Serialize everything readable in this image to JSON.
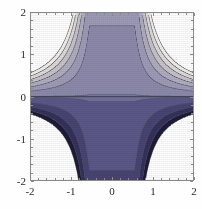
{
  "figure": {
    "kind": "contour-plot",
    "background_color": "#ffffff",
    "frame_color": "#8a8a8a",
    "tick_color": "#8a8a8a",
    "label_color": "#2b2b2b"
  },
  "chart_data": {
    "type": "heatmap",
    "subtype": "filled-contour",
    "title": "",
    "subtitle": "",
    "xlabel": "",
    "ylabel": "",
    "xlim": [
      -2,
      2
    ],
    "ylim": [
      -2,
      2
    ],
    "grid": false,
    "legend": null,
    "legend_position": "none",
    "x_ticks": [
      -2,
      -1,
      0,
      1,
      2
    ],
    "x_tick_labels": [
      "-2",
      "-1",
      "0",
      "1",
      "2"
    ],
    "y_ticks": [
      -2,
      -1,
      0,
      1,
      2
    ],
    "y_tick_labels": [
      "-2",
      "-1",
      "0",
      "1",
      "2"
    ],
    "x_minor_tick_count": 4,
    "y_minor_tick_count": 4,
    "contour_shape": "hyperbolic bands opening toward the four corners, plus a straight horizontal contour along y = 0",
    "zero_contour_line": {
      "axis": "y",
      "value": 0,
      "color": "#3a3a4a"
    },
    "contour_line_color": "#555566",
    "contour_levels": [
      -3,
      -2,
      -1,
      0,
      1,
      2,
      3
    ],
    "color_scale_name": "blue-gray to white (Mathematica default gray-blue)",
    "color_stops": [
      {
        "level": -3,
        "color": "#ffffff",
        "where": "extreme lower-left / lower-right corner tips"
      },
      {
        "level": -2.5,
        "color": "#1d1b38",
        "where": "darkest band, bottom corners"
      },
      {
        "level": -2,
        "color": "#34315c",
        "where": "bottom corners"
      },
      {
        "level": -1.5,
        "color": "#474473",
        "where": "bottom corners"
      },
      {
        "level": -1,
        "color": "#5b5888",
        "where": "lower outer region"
      },
      {
        "level": -0.5,
        "color": "#73709c",
        "where": "lower central region"
      },
      {
        "level": 0,
        "color": "#7e7ba4",
        "where": "just below y = 0"
      },
      {
        "level": 0.5,
        "color": "#8c8aaa",
        "where": "just above y = 0 (central plateau)"
      },
      {
        "level": 1,
        "color": "#9d9bb6",
        "where": "upper central region"
      },
      {
        "level": 1.5,
        "color": "#b0aebe",
        "where": "upper outer region"
      },
      {
        "level": 2,
        "color": "#c6c4c8",
        "where": "top corners"
      },
      {
        "level": 2.5,
        "color": "#dddcd8",
        "where": "top corners"
      },
      {
        "level": 3,
        "color": "#f1f0ea",
        "where": "lightest band, top corners"
      },
      {
        "level": 3.5,
        "color": "#ffffff",
        "where": "extreme upper-left / upper-right corner tips"
      }
    ]
  }
}
